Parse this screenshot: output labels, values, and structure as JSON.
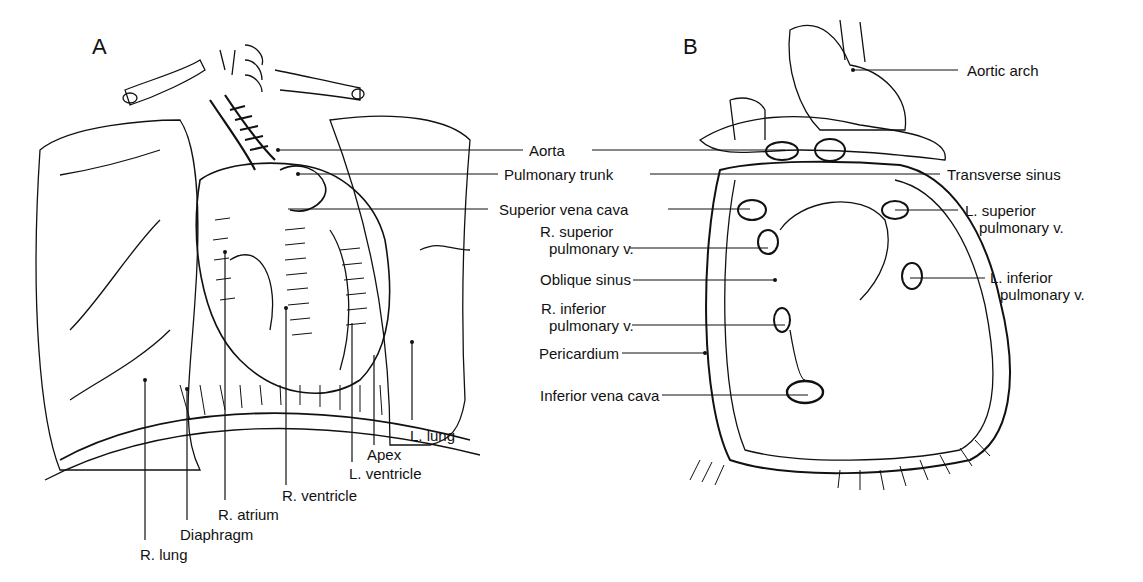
{
  "figure": {
    "panel_a": {
      "letter": "A",
      "labels": {
        "r_lung": "R. lung",
        "diaphragm": "Diaphragm",
        "r_atrium": "R. atrium",
        "r_ventricle": "R. ventricle",
        "l_ventricle": "L. ventricle",
        "apex": "Apex",
        "l_lung": "L. lung"
      }
    },
    "shared_labels": {
      "aorta": "Aorta",
      "pulmonary_trunk": "Pulmonary trunk",
      "superior_vena_cava": "Superior vena cava"
    },
    "panel_b": {
      "letter": "B",
      "labels": {
        "aortic_arch": "Aortic arch",
        "transverse_sinus": "Transverse sinus",
        "l_superior_pulmonary_v_1": "L. superior",
        "l_superior_pulmonary_v_2": "pulmonary v.",
        "r_superior_pulmonary_v_1": "R. superior",
        "r_superior_pulmonary_v_2": "pulmonary v.",
        "oblique_sinus": "Oblique sinus",
        "l_inferior_pulmonary_v_1": "L. inferior",
        "l_inferior_pulmonary_v_2": "pulmonary v.",
        "r_inferior_pulmonary_v_1": "R. inferior",
        "r_inferior_pulmonary_v_2": "pulmonary v.",
        "pericardium": "Pericardium",
        "inferior_vena_cava": "Inferior vena cava"
      }
    },
    "colors": {
      "ink": "#111111",
      "background": "#ffffff"
    }
  }
}
